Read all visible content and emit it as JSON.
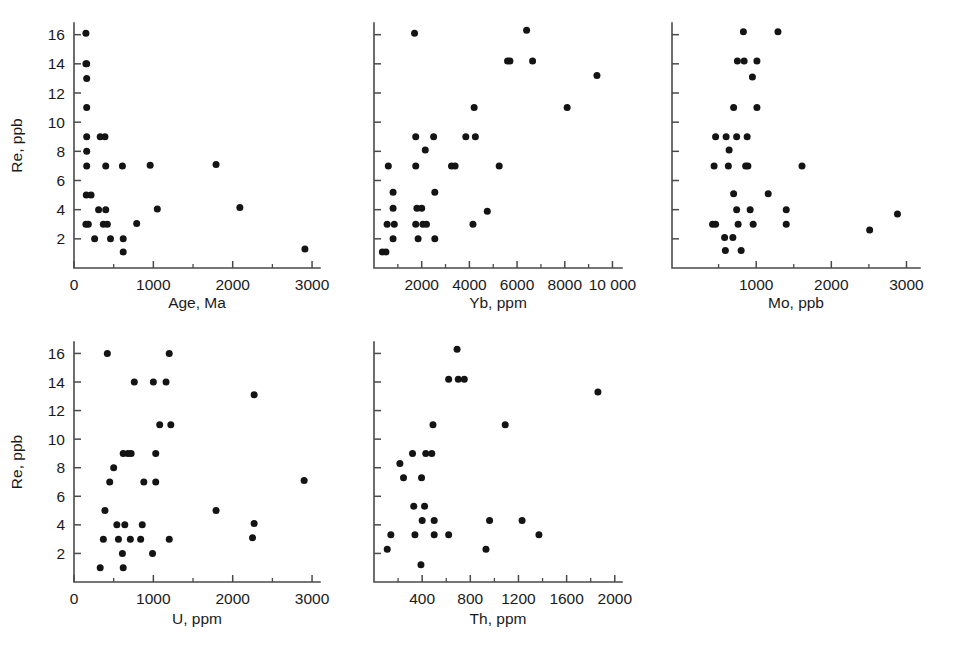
{
  "figure": {
    "background": "#ffffff",
    "point_color": "#141414",
    "axis_color": "#4a4a4a",
    "shared_ylabel": "Re, ppb",
    "panel_count": 5
  },
  "chart_data": [
    {
      "type": "scatter",
      "title": "",
      "xlabel": "Age, Ma",
      "ylabel": "Re, ppb",
      "xlim": [
        0,
        3100
      ],
      "ylim": [
        0,
        16.8
      ],
      "xticks": [
        0,
        1000,
        2000,
        3000
      ],
      "xtick_labels": [
        "0",
        "1000",
        "2000",
        "3000"
      ],
      "xminor": [
        500,
        1500,
        2500
      ],
      "yticks": [
        2,
        4,
        6,
        8,
        10,
        12,
        14,
        16
      ],
      "ytick_labels": [
        "2",
        "4",
        "6",
        "8",
        "10",
        "12",
        "14",
        "16"
      ],
      "grid": false,
      "legend": null,
      "points": [
        [
          150,
          16.1
        ],
        [
          150,
          14.0
        ],
        [
          160,
          14.0
        ],
        [
          160,
          13.0
        ],
        [
          160,
          11.0
        ],
        [
          160,
          9.0
        ],
        [
          330,
          9.0
        ],
        [
          390,
          9.0
        ],
        [
          160,
          8.0
        ],
        [
          160,
          7.0
        ],
        [
          400,
          7.0
        ],
        [
          610,
          7.0
        ],
        [
          960,
          7.05
        ],
        [
          1790,
          7.1
        ],
        [
          155,
          5.0
        ],
        [
          215,
          5.0
        ],
        [
          310,
          4.0
        ],
        [
          400,
          4.0
        ],
        [
          1050,
          4.05
        ],
        [
          2090,
          4.15
        ],
        [
          150,
          3.0
        ],
        [
          180,
          3.0
        ],
        [
          370,
          3.0
        ],
        [
          420,
          3.0
        ],
        [
          790,
          3.05
        ],
        [
          260,
          2.0
        ],
        [
          460,
          2.0
        ],
        [
          620,
          2.0
        ],
        [
          620,
          1.1
        ],
        [
          2910,
          1.3
        ]
      ]
    },
    {
      "type": "scatter",
      "title": "",
      "xlabel": "Yb, ppm",
      "ylabel": "Re, ppb",
      "xlim": [
        0,
        10400
      ],
      "ylim": [
        0,
        16.8
      ],
      "xticks": [
        2000,
        4000,
        6000,
        8000,
        10000
      ],
      "xtick_labels": [
        "2000",
        "4000",
        "6000",
        "8000",
        "10 000"
      ],
      "xminor": [
        1000,
        3000,
        5000,
        7000,
        9000
      ],
      "yticks": [
        2,
        4,
        6,
        8,
        10,
        12,
        14,
        16
      ],
      "ytick_labels": [],
      "grid": false,
      "legend": null,
      "points": [
        [
          1700,
          16.1
        ],
        [
          6400,
          16.3
        ],
        [
          5600,
          14.2
        ],
        [
          5700,
          14.2
        ],
        [
          6650,
          14.2
        ],
        [
          9350,
          13.2
        ],
        [
          4200,
          11.0
        ],
        [
          8100,
          11.0
        ],
        [
          1750,
          9.0
        ],
        [
          2500,
          9.0
        ],
        [
          3850,
          9.0
        ],
        [
          4250,
          9.0
        ],
        [
          2150,
          8.1
        ],
        [
          600,
          7.0
        ],
        [
          1750,
          7.0
        ],
        [
          3250,
          7.0
        ],
        [
          3400,
          7.0
        ],
        [
          5250,
          7.0
        ],
        [
          800,
          5.2
        ],
        [
          2550,
          5.2
        ],
        [
          800,
          4.1
        ],
        [
          1800,
          4.1
        ],
        [
          2000,
          4.1
        ],
        [
          4750,
          3.9
        ],
        [
          550,
          3.0
        ],
        [
          850,
          3.0
        ],
        [
          1750,
          3.0
        ],
        [
          2050,
          3.0
        ],
        [
          2200,
          3.0
        ],
        [
          4150,
          3.0
        ],
        [
          800,
          2.0
        ],
        [
          1850,
          2.0
        ],
        [
          2550,
          2.0
        ],
        [
          350,
          1.1
        ],
        [
          500,
          1.1
        ]
      ]
    },
    {
      "type": "scatter",
      "title": "",
      "xlabel": "Mo, ppb",
      "ylabel": "Re, ppb",
      "xlim": [
        -120,
        3180
      ],
      "ylim": [
        0,
        16.8
      ],
      "xticks": [
        1000,
        2000,
        3000
      ],
      "xtick_labels": [
        "1000",
        "2000",
        "3000"
      ],
      "xminor": [
        500,
        1500,
        2500
      ],
      "yticks": [
        2,
        4,
        6,
        8,
        10,
        12,
        14,
        16
      ],
      "ytick_labels": [],
      "grid": false,
      "legend": null,
      "points": [
        [
          830,
          16.2
        ],
        [
          1290,
          16.2
        ],
        [
          750,
          14.2
        ],
        [
          840,
          14.2
        ],
        [
          1010,
          14.2
        ],
        [
          950,
          13.1
        ],
        [
          700,
          11.0
        ],
        [
          1010,
          11.0
        ],
        [
          460,
          9.0
        ],
        [
          600,
          9.0
        ],
        [
          740,
          9.0
        ],
        [
          880,
          9.0
        ],
        [
          640,
          8.1
        ],
        [
          440,
          7.0
        ],
        [
          630,
          7.0
        ],
        [
          860,
          7.0
        ],
        [
          890,
          7.0
        ],
        [
          1610,
          7.0
        ],
        [
          700,
          5.1
        ],
        [
          1160,
          5.1
        ],
        [
          740,
          4.0
        ],
        [
          920,
          4.0
        ],
        [
          1400,
          4.0
        ],
        [
          2880,
          3.7
        ],
        [
          420,
          3.0
        ],
        [
          460,
          3.0
        ],
        [
          760,
          3.0
        ],
        [
          960,
          3.0
        ],
        [
          1400,
          3.0
        ],
        [
          2510,
          2.6
        ],
        [
          580,
          2.1
        ],
        [
          690,
          2.1
        ],
        [
          590,
          1.2
        ],
        [
          800,
          1.2
        ]
      ]
    },
    {
      "type": "scatter",
      "title": "",
      "xlabel": "U, ppm",
      "ylabel": "Re, ppb",
      "xlim": [
        0,
        3100
      ],
      "ylim": [
        0,
        16.8
      ],
      "xticks": [
        0,
        1000,
        2000,
        3000
      ],
      "xtick_labels": [
        "0",
        "1000",
        "2000",
        "3000"
      ],
      "xminor": [
        500,
        1500,
        2500
      ],
      "yticks": [
        2,
        4,
        6,
        8,
        10,
        12,
        14,
        16
      ],
      "ytick_labels": [
        "2",
        "4",
        "6",
        "8",
        "10",
        "12",
        "14",
        "16"
      ],
      "grid": false,
      "legend": null,
      "points": [
        [
          420,
          16.0
        ],
        [
          1200,
          16.0
        ],
        [
          760,
          14.0
        ],
        [
          1000,
          14.0
        ],
        [
          1160,
          14.0
        ],
        [
          2270,
          13.1
        ],
        [
          1080,
          11.0
        ],
        [
          1220,
          11.0
        ],
        [
          620,
          9.0
        ],
        [
          680,
          9.0
        ],
        [
          720,
          9.0
        ],
        [
          1030,
          9.0
        ],
        [
          500,
          8.0
        ],
        [
          450,
          7.0
        ],
        [
          880,
          7.0
        ],
        [
          1030,
          7.0
        ],
        [
          2900,
          7.1
        ],
        [
          390,
          5.0
        ],
        [
          1790,
          5.0
        ],
        [
          540,
          4.0
        ],
        [
          640,
          4.0
        ],
        [
          860,
          4.0
        ],
        [
          2270,
          4.1
        ],
        [
          370,
          3.0
        ],
        [
          560,
          3.0
        ],
        [
          710,
          3.0
        ],
        [
          840,
          3.0
        ],
        [
          1200,
          3.0
        ],
        [
          2250,
          3.1
        ],
        [
          610,
          2.0
        ],
        [
          990,
          2.0
        ],
        [
          330,
          1.0
        ],
        [
          620,
          1.0
        ]
      ]
    },
    {
      "type": "scatter",
      "title": "",
      "xlabel": "Th, ppm",
      "ylabel": "Re, ppb",
      "xlim": [
        0,
        2060
      ],
      "ylim": [
        0,
        16.8
      ],
      "xticks": [
        400,
        800,
        1200,
        1600,
        2000
      ],
      "xtick_labels": [
        "400",
        "800",
        "1200",
        "1600",
        "2000"
      ],
      "xminor": [
        200,
        600,
        1000,
        1400,
        1800
      ],
      "yticks": [
        2,
        4,
        6,
        8,
        10,
        12,
        14,
        16
      ],
      "ytick_labels": [],
      "grid": false,
      "legend": null,
      "points": [
        [
          690,
          16.3
        ],
        [
          620,
          14.2
        ],
        [
          700,
          14.2
        ],
        [
          750,
          14.2
        ],
        [
          1860,
          13.3
        ],
        [
          490,
          11.0
        ],
        [
          1090,
          11.0
        ],
        [
          320,
          9.0
        ],
        [
          430,
          9.0
        ],
        [
          480,
          9.0
        ],
        [
          215,
          8.3
        ],
        [
          245,
          7.3
        ],
        [
          395,
          7.3
        ],
        [
          330,
          5.3
        ],
        [
          420,
          5.3
        ],
        [
          400,
          4.3
        ],
        [
          500,
          4.3
        ],
        [
          960,
          4.3
        ],
        [
          1230,
          4.3
        ],
        [
          140,
          3.3
        ],
        [
          340,
          3.3
        ],
        [
          500,
          3.3
        ],
        [
          620,
          3.3
        ],
        [
          1370,
          3.3
        ],
        [
          110,
          2.3
        ],
        [
          930,
          2.3
        ],
        [
          390,
          1.2
        ]
      ]
    }
  ],
  "panels": [
    {
      "id": "age",
      "xlabel": "Age, Ma",
      "ylabel": "Re, ppb",
      "show_ylabels": true
    },
    {
      "id": "yb",
      "xlabel": "Yb, ppm",
      "ylabel": "",
      "show_ylabels": false
    },
    {
      "id": "mo",
      "xlabel": "Mo, ppb",
      "ylabel": "",
      "show_ylabels": false
    },
    {
      "id": "u",
      "xlabel": "U, ppm",
      "ylabel": "Re, ppb",
      "show_ylabels": true
    },
    {
      "id": "th",
      "xlabel": "Th, ppm",
      "ylabel": "",
      "show_ylabels": false
    }
  ]
}
